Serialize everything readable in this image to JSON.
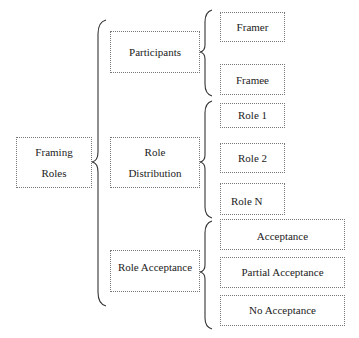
{
  "diagram": {
    "root": {
      "label_line1": "Framing",
      "label_line2": "Roles"
    },
    "categories": [
      {
        "label": "Participants",
        "children": [
          "Framer",
          "Framee"
        ]
      },
      {
        "label_line1": "Role",
        "label_line2": "Distribution",
        "children": [
          "Role 1",
          "Role 2",
          "Role N"
        ]
      },
      {
        "label": "Role Acceptance",
        "children": [
          "Acceptance",
          "Partial Acceptance",
          "No Acceptance"
        ]
      }
    ],
    "colors": {
      "border": "#777777",
      "text": "#222222",
      "brace": "#333333",
      "background": "#ffffff"
    }
  }
}
